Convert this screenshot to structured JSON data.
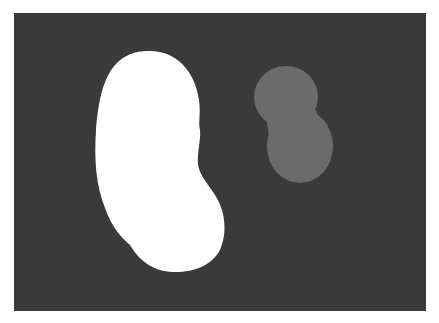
{
  "image": {
    "description": "Grayscale image: a white kidney-shaped blob and a smaller gray peanut-shaped blob on a dark gray background",
    "colors": {
      "page_background": "#ffffff",
      "frame_background": "#3a3a3a",
      "large_blob": "#ffffff",
      "small_blob": "#6b6b6b"
    },
    "shapes": [
      {
        "name": "kidney-blob",
        "fill": "white",
        "bbox": [
          95,
          50,
          227,
          272
        ]
      },
      {
        "name": "peanut-blob",
        "fill": "gray",
        "bbox": [
          254,
          66,
          334,
          184
        ]
      }
    ]
  }
}
